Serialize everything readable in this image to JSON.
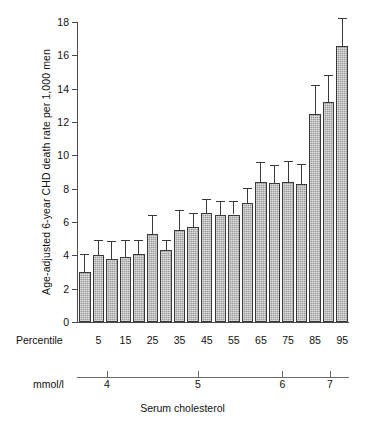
{
  "chart_data": {
    "type": "bar",
    "title": "",
    "xlabel": "Serum cholesterol",
    "ylabel": "Age-adjusted 6-year CHD death rate per 1,000 men",
    "ylim": [
      0,
      18
    ],
    "yticks": [
      0,
      2,
      4,
      6,
      8,
      10,
      12,
      14,
      16,
      18
    ],
    "grid": false,
    "legend": "none",
    "error_bars": "upper only",
    "secondary_axis": {
      "label": "mmol/l",
      "ticks": [
        4,
        5,
        6,
        7
      ],
      "tick_positions_pct": [
        11.0,
        44.5,
        75.5,
        93.0
      ]
    },
    "category_axis_label": "Percentile",
    "categories": [
      "",
      "5",
      "",
      "15",
      "",
      "25",
      "",
      "35",
      "",
      "45",
      "",
      "55",
      "",
      "65",
      "",
      "75",
      "",
      "85",
      "",
      "95"
    ],
    "visible_tick_labels": [
      "5",
      "15",
      "25",
      "35",
      "45",
      "55",
      "65",
      "75",
      "85",
      "95"
    ],
    "values": [
      3.0,
      4.05,
      3.8,
      3.9,
      4.1,
      5.3,
      4.35,
      5.5,
      5.7,
      6.55,
      6.4,
      6.45,
      7.15,
      8.4,
      8.35,
      8.4,
      8.3,
      12.5,
      13.2,
      16.55
    ],
    "error_upper": [
      4.1,
      4.95,
      4.85,
      4.9,
      4.95,
      6.45,
      4.95,
      6.75,
      6.55,
      7.4,
      7.25,
      7.25,
      8.05,
      9.6,
      9.45,
      9.65,
      9.5,
      14.2,
      14.8,
      18.25
    ]
  },
  "axes": {
    "ylabel": "Age-adjusted 6-year CHD death rate per 1,000 men",
    "percentile_label": "Percentile",
    "mmol_label": "mmol/l",
    "caption": "Serum cholesterol"
  },
  "colors": {
    "bar_fill": "#9b9b9b",
    "bar_outline": "#3a3a3a",
    "axis": "#4a4a4a",
    "text": "#111111",
    "background": "#ffffff"
  }
}
